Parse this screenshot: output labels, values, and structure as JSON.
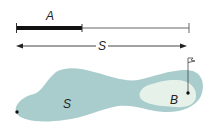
{
  "diagram": {
    "labels": {
      "segment_a": "A",
      "segment_s": "S",
      "region_s": "S",
      "region_b": "B"
    },
    "colors": {
      "fairway": "#a9cccc",
      "green": "#e6f1ea",
      "line": "#222222",
      "thin_line": "#555555"
    }
  }
}
